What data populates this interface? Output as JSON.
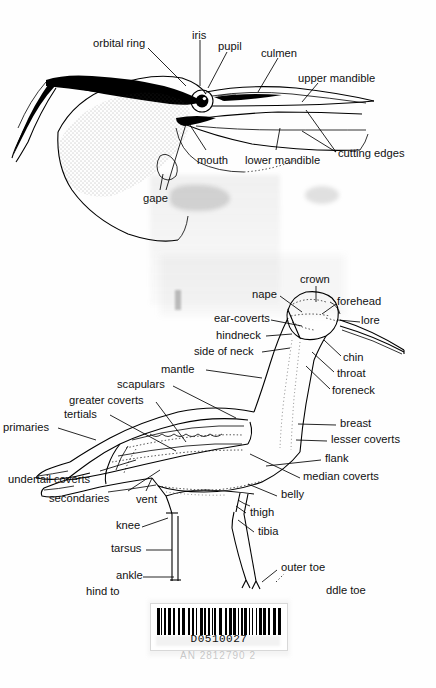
{
  "document": {
    "type": "scanned-book-page",
    "title": "Bird topography plates",
    "figures": [
      {
        "name": "head-and-bill-topography"
      },
      {
        "name": "whole-bird-topography"
      }
    ]
  },
  "head_diagram": {
    "name": "head-and-bill-topography",
    "labels": [
      {
        "id": "orbital-ring",
        "text": "orbital ring",
        "x": 93,
        "y": 38
      },
      {
        "id": "iris",
        "text": "iris",
        "x": 192,
        "y": 30
      },
      {
        "id": "pupil",
        "text": "pupil",
        "x": 220,
        "y": 41
      },
      {
        "id": "culmen",
        "text": "culmen",
        "x": 261,
        "y": 48
      },
      {
        "id": "upper-mandible",
        "text": "upper mandible",
        "x": 298,
        "y": 73
      },
      {
        "id": "cutting-edges",
        "text": "cutting edges",
        "x": 340,
        "y": 150
      },
      {
        "id": "lower-mandible",
        "text": "lower mandible",
        "x": 248,
        "y": 156
      },
      {
        "id": "mouth",
        "text": "mouth",
        "x": 198,
        "y": 157
      },
      {
        "id": "gape",
        "text": "gape",
        "x": 145,
        "y": 196
      }
    ]
  },
  "body_diagram": {
    "name": "whole-bird-topography",
    "labels": [
      {
        "id": "crown",
        "text": "crown",
        "x": 302,
        "y": 276
      },
      {
        "id": "nape",
        "text": "nape",
        "x": 254,
        "y": 291
      },
      {
        "id": "forehead",
        "text": "forehead",
        "x": 337,
        "y": 297
      },
      {
        "id": "ear-coverts",
        "text": "ear-coverts",
        "x": 216,
        "y": 315
      },
      {
        "id": "lore",
        "text": "lore",
        "x": 362,
        "y": 318
      },
      {
        "id": "hindneck",
        "text": "hindneck",
        "x": 218,
        "y": 332
      },
      {
        "id": "side-of-neck",
        "text": "side of neck",
        "x": 196,
        "y": 348
      },
      {
        "id": "chin",
        "text": "chin",
        "x": 343,
        "y": 360
      },
      {
        "id": "mantle",
        "text": "mantle",
        "x": 163,
        "y": 366
      },
      {
        "id": "throat",
        "text": "throat",
        "x": 337,
        "y": 375
      },
      {
        "id": "scapulars",
        "text": "scapulars",
        "x": 119,
        "y": 381
      },
      {
        "id": "foreneck",
        "text": "foreneck",
        "x": 333,
        "y": 393
      },
      {
        "id": "greater-coverts",
        "text": "greater coverts",
        "x": 71,
        "y": 397
      },
      {
        "id": "tertials",
        "text": "tertials",
        "x": 66,
        "y": 411
      },
      {
        "id": "primaries",
        "text": "primaries",
        "x": 4,
        "y": 424
      },
      {
        "id": "breast",
        "text": "breast",
        "x": 340,
        "y": 421
      },
      {
        "id": "lesser-coverts",
        "text": "lesser coverts",
        "x": 331,
        "y": 437
      },
      {
        "id": "flank",
        "text": "flank",
        "x": 325,
        "y": 456
      },
      {
        "id": "undertail-coverts",
        "text": "undertail coverts",
        "x": 10,
        "y": 477
      },
      {
        "id": "median-coverts",
        "text": "median coverts",
        "x": 303,
        "y": 474
      },
      {
        "id": "secondaries",
        "text": "secondaries",
        "x": 51,
        "y": 496
      },
      {
        "id": "vent",
        "text": "vent",
        "x": 137,
        "y": 497
      },
      {
        "id": "belly",
        "text": "belly",
        "x": 281,
        "y": 492
      },
      {
        "id": "thigh",
        "text": "thigh",
        "x": 250,
        "y": 510
      },
      {
        "id": "knee",
        "text": "knee",
        "x": 117,
        "y": 523
      },
      {
        "id": "tibia",
        "text": "tibia",
        "x": 258,
        "y": 529
      },
      {
        "id": "tarsus",
        "text": "tarsus",
        "x": 112,
        "y": 546
      },
      {
        "id": "outer-toe",
        "text": "outer toe",
        "x": 281,
        "y": 565
      },
      {
        "id": "ankle",
        "text": "ankle",
        "x": 117,
        "y": 573
      },
      {
        "id": "hind-toe",
        "text": "hind to",
        "x": 87,
        "y": 589
      },
      {
        "id": "middle-toe",
        "text": "ddle toe",
        "x": 326,
        "y": 588
      }
    ]
  },
  "barcode": {
    "name": "library-barcode-sticker",
    "number": "D0510027",
    "ghost_text": "AN 2812790 2"
  },
  "colors": {
    "ink": "#000000",
    "paper": "#fefefe",
    "ghost": "#8a8a8a"
  }
}
